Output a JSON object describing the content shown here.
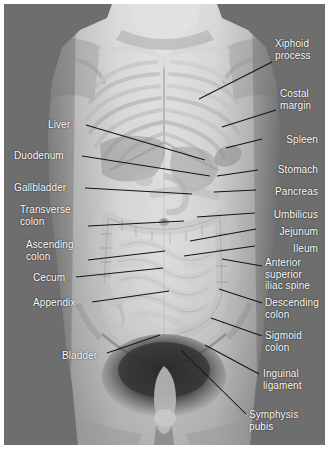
{
  "figure": {
    "background_color": "#6e6e6e",
    "page_color": "#ffffff",
    "label_color": "#ffffff",
    "leader_color": "#141414",
    "width": 329,
    "height": 453
  },
  "labels": [
    {
      "id": "liver",
      "text": "Liver",
      "align": "left",
      "x": 48,
      "y": 119,
      "line": [
        86,
        125,
        205,
        160
      ]
    },
    {
      "id": "duodenum",
      "text": "Duodenum",
      "align": "left",
      "x": 14,
      "y": 150,
      "line": [
        82,
        156,
        210,
        176
      ]
    },
    {
      "id": "gallbladder",
      "text": "Gallbladder",
      "align": "left",
      "x": 14,
      "y": 182,
      "line": [
        85,
        188,
        192,
        194
      ]
    },
    {
      "id": "transverse-colon",
      "text": "Transverse\ncolon",
      "align": "left",
      "x": 20,
      "y": 204,
      "line": [
        88,
        226,
        184,
        221
      ]
    },
    {
      "id": "ascending-colon",
      "text": "Ascending\ncolon",
      "align": "left",
      "x": 26,
      "y": 239,
      "line": [
        88,
        260,
        165,
        251
      ]
    },
    {
      "id": "cecum",
      "text": "Cecum",
      "align": "left",
      "x": 33,
      "y": 272,
      "line": [
        76,
        277,
        163,
        268
      ]
    },
    {
      "id": "appendix",
      "text": "Appendix",
      "align": "left",
      "x": 33,
      "y": 297,
      "line": [
        92,
        302,
        169,
        291
      ]
    },
    {
      "id": "bladder",
      "text": "Bladder",
      "align": "left",
      "x": 62,
      "y": 350,
      "line": [
        107,
        353,
        160,
        335
      ]
    },
    {
      "id": "xiphoid-process",
      "text": "Xiphoid\nprocess",
      "align": "left",
      "x": 275,
      "y": 38,
      "line": [
        272,
        62,
        199,
        99
      ]
    },
    {
      "id": "costal-margin",
      "text": "Costal\nmargin",
      "align": "left",
      "x": 280,
      "y": 88,
      "line": [
        276,
        110,
        222,
        127
      ]
    },
    {
      "id": "spleen",
      "text": "Spleen",
      "align": "right",
      "x": 232,
      "y": 134,
      "line": [
        262,
        139,
        226,
        148
      ]
    },
    {
      "id": "stomach",
      "text": "Stomach",
      "align": "right",
      "x": 232,
      "y": 164,
      "line": [
        258,
        170,
        217,
        176
      ]
    },
    {
      "id": "pancreas",
      "text": "Pancreas",
      "align": "right",
      "x": 232,
      "y": 186,
      "line": [
        256,
        190,
        214,
        192
      ]
    },
    {
      "id": "umbilicus",
      "text": "Umbilicus",
      "align": "right",
      "x": 232,
      "y": 209,
      "line": [
        255,
        213,
        197,
        217
      ]
    },
    {
      "id": "jejunum",
      "text": "Jejunum",
      "align": "right",
      "x": 232,
      "y": 226,
      "line": [
        256,
        229,
        190,
        241
      ]
    },
    {
      "id": "ileum",
      "text": "Ileum",
      "align": "right",
      "x": 232,
      "y": 243,
      "line": [
        255,
        246,
        184,
        256
      ]
    },
    {
      "id": "anterior-superior-iliac-spine",
      "text": "Anterior\nsuperior\niliac spine",
      "align": "left",
      "x": 265,
      "y": 257,
      "line": [
        262,
        266,
        222,
        259
      ]
    },
    {
      "id": "descending-colon",
      "text": "Descending\ncolon",
      "align": "left",
      "x": 265,
      "y": 297,
      "line": [
        262,
        303,
        219,
        289
      ]
    },
    {
      "id": "sigmoid-colon",
      "text": "Sigmoid\ncolon",
      "align": "left",
      "x": 265,
      "y": 330,
      "line": [
        262,
        336,
        211,
        318
      ]
    },
    {
      "id": "inguinal-ligament",
      "text": "Inguinal\nligament",
      "align": "left",
      "x": 263,
      "y": 368,
      "line": [
        259,
        374,
        205,
        345
      ]
    },
    {
      "id": "symphysis-pubis",
      "text": "Symphysis\npubis",
      "align": "left",
      "x": 249,
      "y": 409,
      "line": [
        246,
        414,
        181,
        350
      ]
    }
  ]
}
